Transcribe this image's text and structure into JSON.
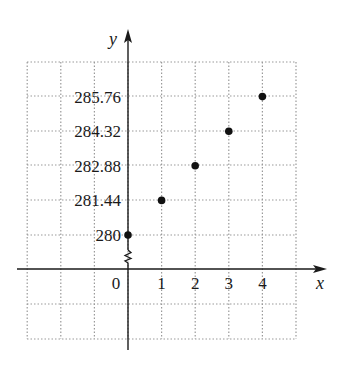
{
  "chart_data": {
    "type": "scatter",
    "title": "",
    "xlabel": "x",
    "ylabel": "y",
    "x": [
      0,
      1,
      2,
      3,
      4
    ],
    "y": [
      280,
      281.44,
      282.88,
      284.32,
      285.76
    ],
    "series": [
      {
        "name": "points",
        "x": [
          0,
          1,
          2,
          3,
          4
        ],
        "y": [
          280,
          281.44,
          282.88,
          284.32,
          285.76
        ]
      }
    ],
    "x_tick_labels": [
      "0",
      "1",
      "2",
      "3",
      "4"
    ],
    "y_tick_labels": [
      "280",
      "281.44",
      "282.88",
      "284.32",
      "285.76"
    ],
    "xlim": [
      -3,
      5
    ],
    "ylim": [
      280,
      285.76
    ],
    "y_axis_break": true,
    "grid": true,
    "grid_style": "dotted",
    "legend": "none",
    "colors": {
      "points": "#111111",
      "axes": "#1a1a1a",
      "grid": "#9a9a9a"
    }
  },
  "labels": {
    "x_axis": "x",
    "y_axis": "y"
  }
}
